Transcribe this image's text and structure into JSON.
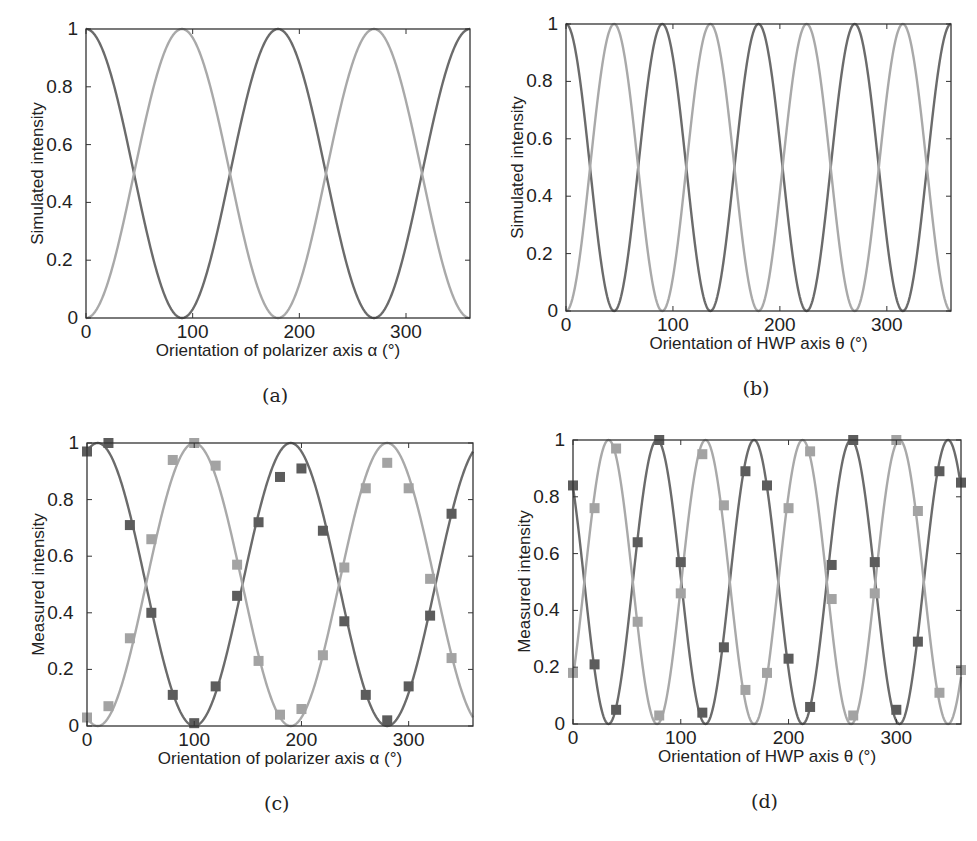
{
  "colors": {
    "dark_curve": "#6b6b6b",
    "light_curve": "#a9a9a9",
    "dark_marker": "#5c5c5c",
    "light_marker": "#a3a3a3",
    "axis": "#333333"
  },
  "chart_data": [
    {
      "id": "a",
      "type": "line",
      "caption": "(a)",
      "title": "",
      "xlabel": "Orientation of polarizer axis α (°)",
      "ylabel": "Simulated intensity",
      "xlim": [
        0,
        360
      ],
      "ylim": [
        0,
        1
      ],
      "xticks": [
        0,
        100,
        200,
        300
      ],
      "yticks": [
        0,
        0.2,
        0.4,
        0.6,
        0.8,
        1
      ],
      "ytick_labels": [
        "0",
        "0.2",
        "0.4",
        "0.6",
        "0.8",
        "1"
      ],
      "grid": false,
      "legend": null,
      "frame_px": {
        "left": 86,
        "top": 29,
        "right": 470,
        "bottom": 318
      },
      "series": [
        {
          "name": "dark curve",
          "model": "cos^2(x)",
          "period_deg": 180,
          "phase_deg": 0,
          "style": "dark",
          "x": [
            0,
            45,
            90,
            135,
            180,
            225,
            270,
            315,
            360
          ],
          "values": [
            1,
            0.5,
            0,
            0.5,
            1,
            0.5,
            0,
            0.5,
            1
          ]
        },
        {
          "name": "light curve",
          "model": "sin^2(x)",
          "period_deg": 180,
          "phase_deg": 90,
          "style": "light",
          "x": [
            0,
            45,
            90,
            135,
            180,
            225,
            270,
            315,
            360
          ],
          "values": [
            0,
            0.5,
            1,
            0.5,
            0,
            0.5,
            1,
            0.5,
            0
          ]
        }
      ]
    },
    {
      "id": "b",
      "type": "line",
      "caption": "(b)",
      "title": "",
      "xlabel": "Orientation of HWP axis θ (°)",
      "ylabel": "Simulated intensity",
      "xlim": [
        0,
        360
      ],
      "ylim": [
        0,
        1
      ],
      "xticks": [
        0,
        100,
        200,
        300
      ],
      "yticks": [
        0,
        0.2,
        0.4,
        0.6,
        0.8,
        1
      ],
      "ytick_labels": [
        "0",
        "0.2",
        "0.4",
        "0.6",
        "0.8",
        "1"
      ],
      "grid": false,
      "legend": null,
      "frame_px": {
        "left": 566,
        "top": 24,
        "right": 951,
        "bottom": 311
      },
      "series": [
        {
          "name": "dark curve",
          "model": "cos^2(2x)",
          "period_deg": 90,
          "phase_deg": 0,
          "style": "dark",
          "x": [
            0,
            22.5,
            45,
            67.5,
            90,
            135,
            180,
            225,
            270,
            315,
            360
          ],
          "values": [
            1,
            0.5,
            0,
            0.5,
            1,
            0,
            1,
            0,
            1,
            0,
            1
          ]
        },
        {
          "name": "light curve",
          "model": "sin^2(2x)",
          "period_deg": 90,
          "phase_deg": 45,
          "style": "light",
          "x": [
            0,
            22.5,
            45,
            67.5,
            90,
            135,
            180,
            225,
            270,
            315,
            360
          ],
          "values": [
            0,
            0.5,
            1,
            0.5,
            0,
            1,
            0,
            1,
            0,
            1,
            0
          ]
        }
      ]
    },
    {
      "id": "c",
      "type": "scatter",
      "caption": "(c)",
      "title": "",
      "xlabel": "Orientation of polarizer axis α (°)",
      "ylabel": "Measured intensity",
      "xlim": [
        0,
        360
      ],
      "ylim": [
        0,
        1
      ],
      "xticks": [
        0,
        100,
        200,
        300
      ],
      "yticks": [
        0,
        0.2,
        0.4,
        0.6,
        0.8,
        1
      ],
      "ytick_labels": [
        "0",
        "0.2",
        "0.4",
        "0.6",
        "0.8",
        "1"
      ],
      "grid": false,
      "legend": null,
      "frame_px": {
        "left": 87,
        "top": 443,
        "right": 473,
        "bottom": 726
      },
      "series": [
        {
          "name": "dark fit",
          "model": "cos^2(x - 10)",
          "period_deg": 180,
          "phase_deg": 10,
          "style": "dark",
          "kind": "line"
        },
        {
          "name": "light fit",
          "model": "sin^2(x - 10)",
          "period_deg": 180,
          "phase_deg": 100,
          "style": "light",
          "kind": "line"
        },
        {
          "name": "dark measured",
          "style": "dark",
          "kind": "marker",
          "x": [
            0,
            20,
            40,
            60,
            80,
            100,
            120,
            140,
            160,
            180,
            200,
            220,
            240,
            260,
            280,
            300,
            320,
            340
          ],
          "values": [
            0.97,
            1.0,
            0.71,
            0.4,
            0.11,
            0.01,
            0.14,
            0.46,
            0.72,
            0.88,
            0.91,
            0.69,
            0.37,
            0.11,
            0.02,
            0.14,
            0.39,
            0.75
          ]
        },
        {
          "name": "light measured",
          "style": "light",
          "kind": "marker",
          "x": [
            0,
            20,
            40,
            60,
            80,
            100,
            120,
            140,
            160,
            180,
            200,
            220,
            240,
            260,
            280,
            300,
            320,
            340
          ],
          "values": [
            0.03,
            0.07,
            0.31,
            0.66,
            0.94,
            1.0,
            0.92,
            0.57,
            0.23,
            0.04,
            0.06,
            0.25,
            0.56,
            0.84,
            0.93,
            0.84,
            0.52,
            0.24
          ]
        }
      ]
    },
    {
      "id": "d",
      "type": "scatter",
      "caption": "(d)",
      "title": "",
      "xlabel": "Orientation of HWP axis θ (°)",
      "ylabel": "Measured intensity",
      "xlim": [
        0,
        360
      ],
      "ylim": [
        0,
        1
      ],
      "xticks": [
        0,
        100,
        200,
        300
      ],
      "yticks": [
        0,
        0.2,
        0.4,
        0.6,
        0.8,
        1
      ],
      "ytick_labels": [
        "0",
        "0.2",
        "0.4",
        "0.6",
        "0.8",
        "1"
      ],
      "grid": false,
      "legend": null,
      "frame_px": {
        "left": 573,
        "top": 440,
        "right": 961,
        "bottom": 724
      },
      "series": [
        {
          "name": "dark fit",
          "model": "cos^2(2(x - 78))",
          "period_deg": 90,
          "phase_deg": 78,
          "style": "dark",
          "kind": "line"
        },
        {
          "name": "light fit",
          "model": "sin^2(2(x - 78))",
          "period_deg": 90,
          "phase_deg": 33,
          "style": "light",
          "kind": "line"
        },
        {
          "name": "dark measured",
          "style": "dark",
          "kind": "marker",
          "x": [
            0,
            20,
            40,
            60,
            80,
            100,
            120,
            140,
            160,
            180,
            200,
            220,
            240,
            260,
            280,
            300,
            320,
            340,
            360
          ],
          "values": [
            0.84,
            0.21,
            0.05,
            0.64,
            1.0,
            0.57,
            0.04,
            0.27,
            0.89,
            0.84,
            0.23,
            0.06,
            0.56,
            1.0,
            0.57,
            0.05,
            0.29,
            0.89,
            0.85
          ]
        },
        {
          "name": "light measured",
          "style": "light",
          "kind": "marker",
          "x": [
            0,
            20,
            40,
            60,
            80,
            100,
            120,
            140,
            160,
            180,
            200,
            220,
            240,
            260,
            280,
            300,
            320,
            340,
            360
          ],
          "values": [
            0.18,
            0.76,
            0.97,
            0.36,
            0.03,
            0.46,
            0.95,
            0.77,
            0.12,
            0.18,
            0.76,
            0.96,
            0.44,
            0.03,
            0.46,
            1.0,
            0.75,
            0.11,
            0.19
          ]
        }
      ]
    }
  ]
}
